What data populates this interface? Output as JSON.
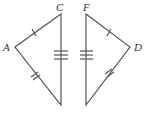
{
  "diagram": {
    "type": "congruent-triangles",
    "stroke_color": "#555555",
    "labels": {
      "A": "A",
      "C": "C",
      "F": "F",
      "D": "D"
    },
    "triangles": [
      {
        "name": "ACB",
        "vertices": [
          "A",
          "C",
          "(unlabeled bottom)"
        ],
        "marks": {
          "A-C": 1,
          "A-bottom": 2,
          "C-bottom": 3
        }
      },
      {
        "name": "FDE",
        "vertices": [
          "F",
          "D",
          "(unlabeled bottom)"
        ],
        "marks": {
          "F-D": 1,
          "D-bottom": 2,
          "F-bottom": 3
        }
      }
    ]
  }
}
